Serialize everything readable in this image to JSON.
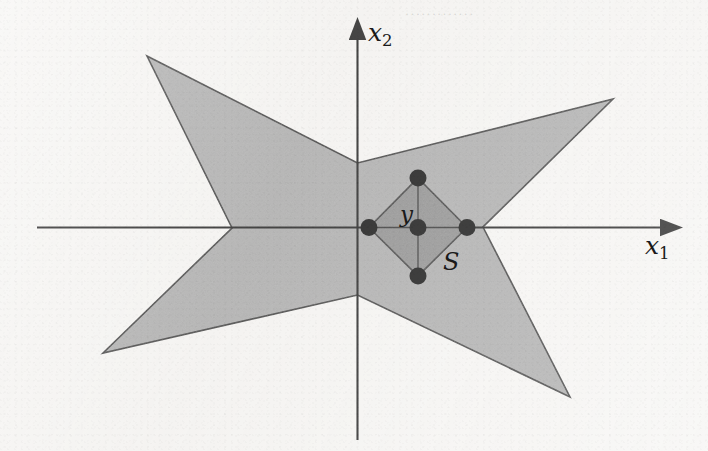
{
  "figure": {
    "width": 708,
    "height": 451,
    "background_color": "#f6f5f3",
    "ink_color": "#222222"
  },
  "axes": {
    "origin": {
      "x": 357.5,
      "y": 227.5
    },
    "x_axis": {
      "label": "x",
      "subscript": "1",
      "start": {
        "x": 37,
        "y": 227.5
      },
      "end": {
        "x": 672,
        "y": 227.5
      },
      "arrow": "right",
      "label_pos": {
        "x": 645,
        "y": 233
      }
    },
    "y_axis": {
      "label": "x",
      "subscript": "2",
      "start": {
        "x": 357.5,
        "y": 440
      },
      "end": {
        "x": 357.5,
        "y": 28
      },
      "arrow": "up",
      "label_pos": {
        "x": 368,
        "y": 20
      }
    }
  },
  "shapes": {
    "outer_star": {
      "name": "star-region",
      "fill": "#ababab",
      "stroke": "#2b2b2b",
      "stroke_width": 1.6,
      "points": [
        {
          "x": 147,
          "y": 56
        },
        {
          "x": 357.5,
          "y": 163
        },
        {
          "x": 613,
          "y": 99
        },
        {
          "x": 483,
          "y": 227
        },
        {
          "x": 570,
          "y": 397
        },
        {
          "x": 357.5,
          "y": 295
        },
        {
          "x": 103,
          "y": 353
        },
        {
          "x": 232,
          "y": 228
        }
      ]
    },
    "inner_diamond": {
      "name": "set-S",
      "label": "S",
      "fill": "#8b8b8b",
      "stroke": "#2b2b2b",
      "stroke_width": 1.6,
      "center": {
        "x": 418,
        "y": 227.5
      },
      "points": [
        {
          "x": 418,
          "y": 178
        },
        {
          "x": 467,
          "y": 227.5
        },
        {
          "x": 418,
          "y": 276
        },
        {
          "x": 369,
          "y": 227.5
        }
      ],
      "label_pos": {
        "x": 443,
        "y": 250
      }
    }
  },
  "points": [
    {
      "name": "point-y-center",
      "label": "y",
      "x": 418,
      "y": 227.5,
      "r": 8.5,
      "color": "#111111",
      "label_pos": {
        "x": 400,
        "y": 203
      }
    },
    {
      "name": "point-top",
      "label": "",
      "x": 418,
      "y": 178,
      "r": 8.5,
      "color": "#111111"
    },
    {
      "name": "point-right",
      "label": "",
      "x": 467,
      "y": 227.5,
      "r": 8.5,
      "color": "#111111"
    },
    {
      "name": "point-bottom",
      "label": "",
      "x": 418,
      "y": 276,
      "r": 8.5,
      "color": "#111111"
    },
    {
      "name": "point-left",
      "label": "",
      "x": 369,
      "y": 227.5,
      "r": 8.5,
      "color": "#111111"
    }
  ],
  "crosshair": {
    "name": "diamond-crosshair",
    "stroke": "#333333",
    "stroke_width": 1.3,
    "segments": [
      {
        "x1": 418,
        "y1": 178,
        "x2": 418,
        "y2": 276
      },
      {
        "x1": 369,
        "y1": 227.5,
        "x2": 467,
        "y2": 227.5
      }
    ]
  },
  "artifacts": {
    "top_ghost_text": "·············"
  }
}
